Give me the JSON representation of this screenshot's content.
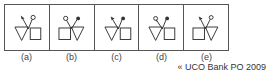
{
  "figure": {
    "type": "answer-figures",
    "panels": [
      {
        "label": "(a)",
        "left_shape": "triangle",
        "right_shape": "square",
        "left_end": "arrow",
        "right_end": "open-circle"
      },
      {
        "label": "(b)",
        "left_shape": "square",
        "right_shape": "triangle",
        "left_end": "open-circle",
        "right_end": "filled-dot"
      },
      {
        "label": "(c)",
        "left_shape": "triangle",
        "right_shape": "square",
        "left_end": "arrow",
        "right_end": "filled-dot"
      },
      {
        "label": "(d)",
        "left_shape": "triangle",
        "right_shape": "square",
        "left_end": "open-circle",
        "right_end": "filled-dot"
      },
      {
        "label": "(e)",
        "left_shape": "square",
        "right_shape": "triangle",
        "left_end": "arrow",
        "right_end": "open-circle"
      }
    ]
  },
  "source": "« UCO Bank PO 2009",
  "colors": {
    "stroke": "#333333",
    "border": "#555555"
  }
}
